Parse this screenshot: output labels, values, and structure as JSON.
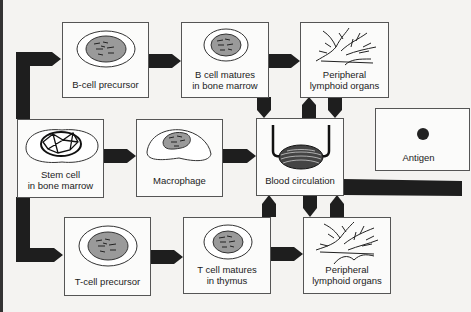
{
  "diagram": {
    "title": "",
    "nodes": [
      {
        "id": "b_precursor",
        "label": "B-cell precursor"
      },
      {
        "id": "b_matures",
        "label_line1": "B cell matures",
        "label_line2": "in bone marrow"
      },
      {
        "id": "peripheral_top",
        "label_line1": "Peripheral",
        "label_line2": "lymphoid organs"
      },
      {
        "id": "stem_cell",
        "label_line1": "Stem cell",
        "label_line2": "in bone marrow"
      },
      {
        "id": "macrophage",
        "label": "Macrophage"
      },
      {
        "id": "blood",
        "label": "Blood circulation"
      },
      {
        "id": "antigen",
        "label": "Antigen"
      },
      {
        "id": "t_precursor",
        "label": "T-cell precursor"
      },
      {
        "id": "t_matures",
        "label_line1": "T cell matures",
        "label_line2": "in thymus"
      },
      {
        "id": "peripheral_bottom",
        "label_line1": "Peripheral",
        "label_line2": "lymphoid organs"
      }
    ],
    "edges": [
      {
        "from": "stem_cell",
        "to": "b_precursor"
      },
      {
        "from": "stem_cell",
        "to": "t_precursor"
      },
      {
        "from": "stem_cell",
        "to": "macrophage"
      },
      {
        "from": "b_precursor",
        "to": "b_matures"
      },
      {
        "from": "b_matures",
        "to": "peripheral_top"
      },
      {
        "from": "b_matures",
        "to": "blood"
      },
      {
        "from": "blood",
        "to": "peripheral_top"
      },
      {
        "from": "peripheral_top",
        "to": "blood"
      },
      {
        "from": "macrophage",
        "to": "blood"
      },
      {
        "from": "t_precursor",
        "to": "t_matures"
      },
      {
        "from": "t_matures",
        "to": "peripheral_bottom"
      },
      {
        "from": "t_matures",
        "to": "blood"
      },
      {
        "from": "blood",
        "to": "peripheral_bottom"
      },
      {
        "from": "peripheral_bottom",
        "to": "blood"
      },
      {
        "from": "blood",
        "to": "antigen-side (off right edge)"
      }
    ],
    "colors": {
      "arrow": "#1e1e1e",
      "box_border": "#555555",
      "nucleus_fill": "#9a9a9a",
      "background": "#f4f3f1"
    }
  }
}
